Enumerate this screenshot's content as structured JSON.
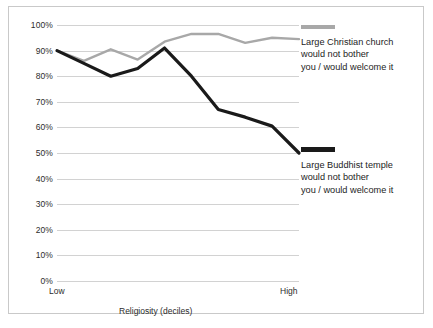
{
  "chart_data": {
    "type": "line",
    "title": "",
    "xlabel": "Religiosity (deciles)",
    "ylabel": "",
    "x": [
      1,
      2,
      3,
      4,
      5,
      6,
      7,
      8,
      9,
      10
    ],
    "xtick_labels": [
      "Low",
      "",
      "",
      "",
      "",
      "",
      "",
      "",
      "",
      "High"
    ],
    "ytick_labels": [
      "100%",
      "90%",
      "80%",
      "70%",
      "60%",
      "50%",
      "40%",
      "30%",
      "20%",
      "10%",
      "0%"
    ],
    "ytick_values": [
      100,
      90,
      80,
      70,
      60,
      50,
      40,
      30,
      20,
      10,
      0
    ],
    "ylim": [
      0,
      100
    ],
    "grid": true,
    "legend_position": "right",
    "series": [
      {
        "name": "Large Christian church would not bother you / would welcome it",
        "color": "#a8a8a8",
        "values": [
          90,
          86,
          90.5,
          86.5,
          93.5,
          96.5,
          96.5,
          93,
          95,
          94.5
        ]
      },
      {
        "name": "Large Buddhist temple would not bother you / would welcome it",
        "color": "#1a1a1a",
        "values": [
          90,
          85,
          80,
          83,
          91,
          80,
          67,
          64,
          60.5,
          50
        ]
      }
    ]
  },
  "axis": {
    "x_title": "Religiosity (deciles)",
    "x_low_label": "Low",
    "x_high_label": "High",
    "y_labels": [
      "100%",
      "90%",
      "80%",
      "70%",
      "60%",
      "50%",
      "40%",
      "30%",
      "20%",
      "10%",
      "0%"
    ]
  },
  "legend": {
    "items": [
      {
        "label": "Large Christian church\nwould not bother\nyou / would welcome it",
        "color": "#a8a8a8"
      },
      {
        "label": "Large Buddhist temple\nwould not bother\nyou / would welcome it",
        "color": "#1a1a1a"
      }
    ]
  }
}
